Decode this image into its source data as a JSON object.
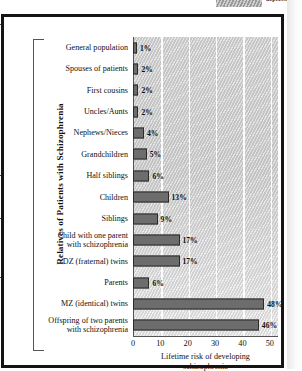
{
  "top_legend": {
    "cropped_label": "depressed",
    "swatch_name": "hatched-swatch"
  },
  "chart_data": {
    "type": "bar",
    "orientation": "horizontal",
    "title": "",
    "xlabel": "Lifetime risk of developing schizophrenia",
    "xlabel_line1": "Lifetime risk of developing",
    "xlabel_line2": "schizophrenia",
    "ylabel": "Relatives of Patients with Schizophrenia",
    "xlim": [
      0,
      53
    ],
    "xticks": [
      0,
      10,
      20,
      30,
      40,
      50
    ],
    "xtick_labels": [
      "0",
      "10",
      "20",
      "30",
      "40",
      "50"
    ],
    "grid": true,
    "grid_axis": "x",
    "legend": "none",
    "unit": "%",
    "bar_color": "#6d6d6d",
    "bar_edge_color": "#2b2b2b",
    "panel_color": "#d2d2d2",
    "categories": [
      "General population",
      "Spouses of patients",
      "First cousins",
      "Uncles/Aunts",
      "Nephews/Nieces",
      "Grandchildren",
      "Half siblings",
      "Children",
      "Siblings",
      "Child with one parent with schizophrenia",
      "DZ (fraternal) twins",
      "Parents",
      "MZ (identical) twins",
      "Offspring of two parents with schizophrenia"
    ],
    "values": [
      1,
      2,
      2,
      2,
      4,
      5,
      6,
      13,
      9,
      17,
      17,
      6,
      48,
      46
    ],
    "value_labels": [
      "1%",
      "2%",
      "2%",
      "2%",
      "4%",
      "5%",
      "6%",
      "13%",
      "9%",
      "17%",
      "17%",
      "6%",
      "48%",
      "46%"
    ],
    "rows": [
      {
        "label_line1": "General population",
        "label_line2": "",
        "value": 1,
        "value_label": "1%"
      },
      {
        "label_line1": "Spouses of patients",
        "label_line2": "",
        "value": 2,
        "value_label": "2%"
      },
      {
        "label_line1": "First cousins",
        "label_line2": "",
        "value": 2,
        "value_label": "2%"
      },
      {
        "label_line1": "Uncles/Aunts",
        "label_line2": "",
        "value": 2,
        "value_label": "2%"
      },
      {
        "label_line1": "Nephews/Nieces",
        "label_line2": "",
        "value": 4,
        "value_label": "4%"
      },
      {
        "label_line1": "Grandchildren",
        "label_line2": "",
        "value": 5,
        "value_label": "5%"
      },
      {
        "label_line1": "Half siblings",
        "label_line2": "",
        "value": 6,
        "value_label": "6%"
      },
      {
        "label_line1": "Children",
        "label_line2": "",
        "value": 13,
        "value_label": "13%"
      },
      {
        "label_line1": "Siblings",
        "label_line2": "",
        "value": 9,
        "value_label": "9%"
      },
      {
        "label_line1": "Child with one parent",
        "label_line2": "with schizophrenia",
        "value": 17,
        "value_label": "17%"
      },
      {
        "label_line1": "DZ (fraternal) twins",
        "label_line2": "",
        "value": 17,
        "value_label": "17%"
      },
      {
        "label_line1": "Parents",
        "label_line2": "",
        "value": 6,
        "value_label": "6%"
      },
      {
        "label_line1": "MZ (identical) twins",
        "label_line2": "",
        "value": 48,
        "value_label": "48%"
      },
      {
        "label_line1": "Offspring of two parents",
        "label_line2": "with schizophrenia",
        "value": 46,
        "value_label": "46%"
      }
    ]
  }
}
